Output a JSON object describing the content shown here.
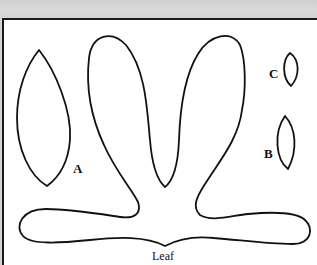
{
  "diagram": {
    "type": "sewing-pattern-template",
    "labels": {
      "a": "A",
      "b": "B",
      "c": "C",
      "leaf": "Leaf"
    },
    "pieces": [
      {
        "id": "A",
        "shape": "large pointed oval leaf"
      },
      {
        "id": "B",
        "shape": "small pointed oval"
      },
      {
        "id": "C",
        "shape": "smallest pointed oval"
      },
      {
        "id": "Leaf",
        "shape": "four-lobed leaf cluster with two upright petals and two horizontal arms"
      }
    ],
    "colors": {
      "outline": "#111111",
      "paper": "#ffffff",
      "background": "#d4d4d4"
    }
  }
}
